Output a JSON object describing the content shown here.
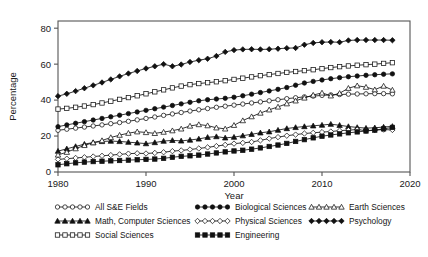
{
  "chart_data": {
    "type": "line",
    "title": "",
    "xlabel": "Year",
    "ylabel": "Percentage",
    "xlim": [
      1980,
      2020
    ],
    "ylim": [
      0,
      84
    ],
    "xticks": [
      1980,
      1990,
      2000,
      2010,
      2020
    ],
    "yticks": [
      0,
      20,
      40,
      60,
      80
    ],
    "grid": false,
    "legend_position": "below",
    "x": [
      1980,
      1981,
      1982,
      1983,
      1984,
      1985,
      1986,
      1987,
      1988,
      1989,
      1990,
      1991,
      1992,
      1993,
      1994,
      1995,
      1996,
      1997,
      1998,
      1999,
      2000,
      2001,
      2002,
      2003,
      2004,
      2005,
      2006,
      2007,
      2008,
      2009,
      2010,
      2011,
      2012,
      2013,
      2014,
      2015,
      2016,
      2017,
      2018
    ],
    "series": [
      {
        "name": "All S&E Fields",
        "marker": "open-circle",
        "values": [
          23.2,
          23.8,
          24.4,
          25.0,
          25.6,
          26.2,
          26.9,
          27.5,
          28.2,
          29.0,
          29.8,
          30.6,
          31.5,
          32.3,
          33.1,
          33.9,
          34.6,
          35.3,
          36.0,
          36.6,
          37.2,
          37.8,
          38.4,
          39.0,
          39.6,
          40.2,
          40.8,
          41.3,
          41.8,
          42.2,
          42.6,
          42.9,
          43.1,
          43.3,
          43.4,
          43.5,
          43.6,
          43.6,
          43.5
        ]
      },
      {
        "name": "Math, Computer Sciences",
        "marker": "filled-triangle",
        "values": [
          11.6,
          12.9,
          14.2,
          15.5,
          16.4,
          17.0,
          17.2,
          17.0,
          16.6,
          16.2,
          15.8,
          16.4,
          17.2,
          17.6,
          17.3,
          17.8,
          18.4,
          19.3,
          19.7,
          19.0,
          19.4,
          20.2,
          21.0,
          21.8,
          22.4,
          23.3,
          24.2,
          24.8,
          25.3,
          25.7,
          26.1,
          26.6,
          26.0,
          25.3,
          24.8,
          24.4,
          24.6,
          25.0,
          25.4
        ]
      },
      {
        "name": "Social Sciences",
        "marker": "open-square",
        "values": [
          35.0,
          35.4,
          36.0,
          36.7,
          37.5,
          38.4,
          39.4,
          40.4,
          41.4,
          42.4,
          43.5,
          44.6,
          45.7,
          46.8,
          47.8,
          48.6,
          49.2,
          49.7,
          50.2,
          50.8,
          51.5,
          52.2,
          52.9,
          53.6,
          54.2,
          54.8,
          55.4,
          55.9,
          56.4,
          56.9,
          57.5,
          58.1,
          58.6,
          59.0,
          59.4,
          59.7,
          60.0,
          60.4,
          60.8
        ]
      },
      {
        "name": "Biological Sciences",
        "marker": "filled-circle",
        "values": [
          25.2,
          26.2,
          27.1,
          28.0,
          28.9,
          29.8,
          30.7,
          31.6,
          32.5,
          33.4,
          34.3,
          35.2,
          36.1,
          37.0,
          37.9,
          38.8,
          39.6,
          40.2,
          40.6,
          41.0,
          41.6,
          42.4,
          43.3,
          44.2,
          45.1,
          46.0,
          47.0,
          48.3,
          49.5,
          50.4,
          51.2,
          51.9,
          52.5,
          53.0,
          53.4,
          53.8,
          54.1,
          54.4,
          54.6
        ]
      },
      {
        "name": "Physical Sciences",
        "marker": "open-diamond",
        "values": [
          7.0,
          7.4,
          7.8,
          8.2,
          8.6,
          9.0,
          9.4,
          9.8,
          10.2,
          10.4,
          10.3,
          10.6,
          11.0,
          11.6,
          12.0,
          12.5,
          13.1,
          13.7,
          14.4,
          15.1,
          15.8,
          16.2,
          16.7,
          17.6,
          18.6,
          19.4,
          20.2,
          20.8,
          21.4,
          21.8,
          22.2,
          22.5,
          23.0,
          23.3,
          23.6,
          23.0,
          23.3,
          23.6,
          23.4
        ]
      },
      {
        "name": "Engineering",
        "marker": "filled-square",
        "values": [
          4.0,
          4.6,
          5.1,
          5.5,
          5.8,
          6.0,
          6.2,
          6.4,
          6.6,
          6.8,
          7.0,
          7.2,
          7.6,
          8.2,
          8.7,
          9.0,
          9.4,
          10.0,
          10.6,
          11.2,
          11.7,
          12.1,
          12.7,
          13.4,
          14.2,
          15.0,
          15.9,
          17.0,
          18.0,
          19.0,
          19.9,
          20.6,
          21.2,
          21.8,
          22.3,
          22.8,
          23.3,
          24.0,
          24.8
        ]
      },
      {
        "name": "Earth Sciences",
        "marker": "open-triangle",
        "values": [
          9.5,
          11.0,
          13.0,
          14.8,
          16.3,
          17.5,
          19.2,
          20.5,
          21.6,
          22.4,
          22.0,
          21.5,
          22.2,
          23.0,
          24.0,
          25.6,
          26.4,
          25.8,
          24.6,
          24.0,
          26.0,
          28.6,
          30.8,
          32.8,
          34.6,
          36.2,
          38.0,
          39.6,
          41.2,
          42.8,
          44.0,
          42.4,
          43.8,
          46.6,
          48.0,
          47.2,
          45.8,
          47.8,
          45.6
        ]
      },
      {
        "name": "Psychology",
        "marker": "filled-diamond",
        "values": [
          42.2,
          43.5,
          45.0,
          46.6,
          48.2,
          49.8,
          51.5,
          53.2,
          54.8,
          56.2,
          57.6,
          58.8,
          60.0,
          58.8,
          59.8,
          61.2,
          62.2,
          63.0,
          64.5,
          66.8,
          67.8,
          68.2,
          68.3,
          68.2,
          68.3,
          68.6,
          68.9,
          69.0,
          70.8,
          71.8,
          72.2,
          72.3,
          72.2,
          73.2,
          73.4,
          73.4,
          73.4,
          73.4,
          73.3
        ]
      }
    ],
    "legend": [
      {
        "label": "All S&E Fields",
        "marker": "open-circle",
        "col": 0,
        "row": 0
      },
      {
        "label": "Math, Computer Sciences",
        "marker": "filled-triangle",
        "col": 0,
        "row": 1
      },
      {
        "label": "Social Sciences",
        "marker": "open-square",
        "col": 0,
        "row": 2
      },
      {
        "label": "Biological Sciences",
        "marker": "filled-circle",
        "col": 1,
        "row": 0
      },
      {
        "label": "Physical Sciences",
        "marker": "open-diamond",
        "col": 1,
        "row": 1
      },
      {
        "label": "Engineering",
        "marker": "filled-square",
        "col": 1,
        "row": 2
      },
      {
        "label": "Earth Sciences",
        "marker": "open-triangle",
        "col": 2,
        "row": 0
      },
      {
        "label": "Psychology",
        "marker": "filled-diamond",
        "col": 2,
        "row": 1
      }
    ]
  }
}
